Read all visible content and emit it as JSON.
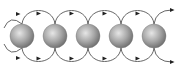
{
  "diagram": {
    "type": "sphere-chain-flow",
    "sphere_count": 5,
    "spheres": [
      {
        "cx": 22,
        "cy": 36,
        "r": 12
      },
      {
        "cx": 55,
        "cy": 36,
        "r": 12
      },
      {
        "cx": 88,
        "cy": 36,
        "r": 12
      },
      {
        "cx": 121,
        "cy": 36,
        "r": 12
      },
      {
        "cx": 154,
        "cy": 36,
        "r": 12
      }
    ],
    "colors": {
      "sphere_light": "#e6e6e6",
      "sphere_mid": "#a8a8a8",
      "sphere_dark": "#6e6e6e",
      "line": "#555555",
      "arrow": "#222222",
      "background": "#ffffff"
    },
    "arrow_direction": "right"
  }
}
